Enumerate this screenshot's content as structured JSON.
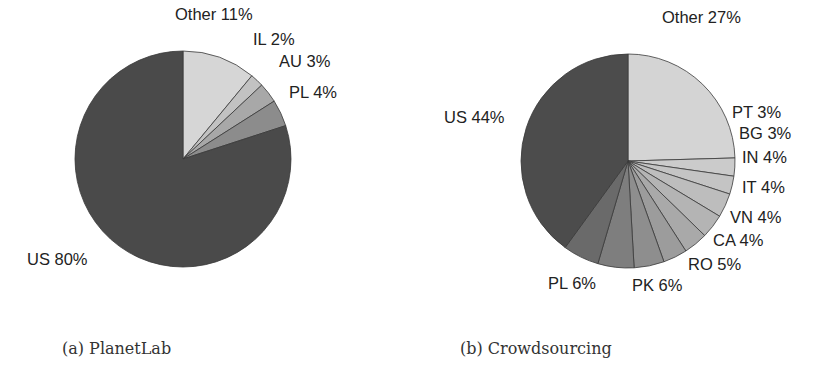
{
  "chart_data": [
    {
      "type": "pie",
      "title": "(a) PlanetLab",
      "start_angle_deg": 0,
      "direction": "clockwise",
      "center": [
        183,
        159
      ],
      "radius": 108,
      "slices": [
        {
          "label": "Other",
          "value": 11,
          "text": "Other 11%",
          "color": "#d6d6d6",
          "lx": 175,
          "ly": 20,
          "anchor": "start"
        },
        {
          "label": "IL",
          "value": 2,
          "text": "IL 2%",
          "color": "#c2c2c2",
          "lx": 253,
          "ly": 45,
          "anchor": "start"
        },
        {
          "label": "AU",
          "value": 3,
          "text": "AU 3%",
          "color": "#a8a8a8",
          "lx": 279,
          "ly": 67,
          "anchor": "start"
        },
        {
          "label": "PL",
          "value": 4,
          "text": "PL 4%",
          "color": "#8c8c8c",
          "lx": 289,
          "ly": 98,
          "anchor": "start"
        },
        {
          "label": "US",
          "value": 80,
          "text": "US 80%",
          "color": "#4a4a4a",
          "lx": 27,
          "ly": 265,
          "anchor": "start"
        }
      ]
    },
    {
      "type": "pie",
      "title": "(b) Crowdsourcing",
      "start_angle_deg": 0,
      "direction": "clockwise",
      "center": [
        628,
        161
      ],
      "radius": 107,
      "note": "Labelled percentages sum to 110% (rounding in source); slices drawn proportionally.",
      "slices": [
        {
          "label": "Other",
          "value": 27,
          "text": "Other 27%",
          "color": "#d4d4d4",
          "lx": 662,
          "ly": 23,
          "anchor": "start"
        },
        {
          "label": "PT",
          "value": 3,
          "text": "PT 3%",
          "color": "#cbcbcb",
          "lx": 732,
          "ly": 118,
          "anchor": "start"
        },
        {
          "label": "BG",
          "value": 3,
          "text": "BG 3%",
          "color": "#c4c4c4",
          "lx": 739,
          "ly": 139,
          "anchor": "start"
        },
        {
          "label": "IN",
          "value": 4,
          "text": "IN 4%",
          "color": "#bdbdbd",
          "lx": 742,
          "ly": 163,
          "anchor": "start"
        },
        {
          "label": "IT",
          "value": 4,
          "text": "IT 4%",
          "color": "#b4b4b4",
          "lx": 742,
          "ly": 193,
          "anchor": "start"
        },
        {
          "label": "VN",
          "value": 4,
          "text": "VN 4%",
          "color": "#a9a9a9",
          "lx": 730,
          "ly": 223,
          "anchor": "start"
        },
        {
          "label": "CA",
          "value": 4,
          "text": "CA 4%",
          "color": "#9c9c9c",
          "lx": 713,
          "ly": 246,
          "anchor": "start"
        },
        {
          "label": "RO",
          "value": 5,
          "text": "RO 5%",
          "color": "#8e8e8e",
          "lx": 688,
          "ly": 270,
          "anchor": "start"
        },
        {
          "label": "PK",
          "value": 6,
          "text": "PK 6%",
          "color": "#7e7e7e",
          "lx": 632,
          "ly": 291,
          "anchor": "start"
        },
        {
          "label": "PL",
          "value": 6,
          "text": "PL 6%",
          "color": "#6a6a6a",
          "lx": 548,
          "ly": 289,
          "anchor": "start"
        },
        {
          "label": "US",
          "value": 44,
          "text": "US 44%",
          "color": "#4c4c4c",
          "lx": 444,
          "ly": 123,
          "anchor": "start"
        }
      ]
    }
  ],
  "captions": {
    "a": "(a) PlanetLab",
    "b": "(b) Crowdsourcing"
  },
  "stroke_color": "#3a3a3a"
}
